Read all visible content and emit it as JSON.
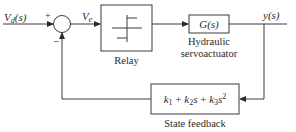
{
  "diagram": {
    "type": "block-diagram",
    "input": {
      "label": "V_d(s)",
      "display": "Vd(s)",
      "sub": "d"
    },
    "summing_junction": {
      "plus_sign": "+",
      "minus_sign": "−"
    },
    "error_signal": {
      "label": "V_e",
      "sub": "e"
    },
    "blocks": [
      {
        "id": "relay",
        "content": "relay-characteristic",
        "caption": "Relay"
      },
      {
        "id": "plant",
        "content": "G(s)",
        "caption_lines": [
          "Hydraulic",
          "servoactuator"
        ]
      },
      {
        "id": "feedback",
        "content": "k1 + k2s + k3s^2",
        "caption": "State feedback"
      }
    ],
    "output": {
      "label": "y(s)"
    },
    "colors": {
      "line": "#3a3a3a",
      "text": "#2a2a2a",
      "background": "#ffffff"
    }
  }
}
